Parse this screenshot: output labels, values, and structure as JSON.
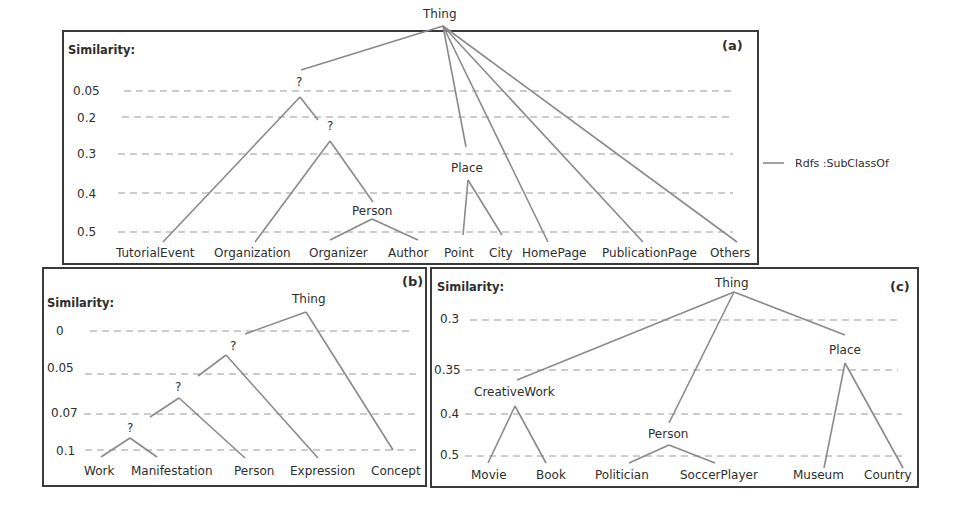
{
  "legend": {
    "line_label": "Rdfs :SubClassOf"
  },
  "colors": {
    "edge": "#8a8a8a",
    "dash": "#9a9a9a",
    "frame": "#3a3a3a",
    "text": "#2e2e2e"
  },
  "panels": [
    {
      "tag": "(a)",
      "axis_title": "Similarity:",
      "levels": [
        "0.05",
        "0.2",
        "0.3",
        "0.4",
        "0.5"
      ],
      "root": "Thing",
      "internal_nodes": [
        "?",
        "?",
        "Person",
        "Place"
      ],
      "leaves": [
        "TutorialEvent",
        "Organization",
        "Organizer",
        "Author",
        "Point",
        "City",
        "HomePage",
        "PublicationPage",
        "Others"
      ]
    },
    {
      "tag": "(b)",
      "axis_title": "Similarity:",
      "levels": [
        "0",
        "0.05",
        "0.07",
        "0.1"
      ],
      "root": "Thing",
      "internal_nodes": [
        "?",
        "?",
        "?"
      ],
      "leaves": [
        "Work",
        "Manifestation",
        "Person",
        "Expression",
        "Concept"
      ]
    },
    {
      "tag": "(c)",
      "axis_title": "Similarity:",
      "levels": [
        "0.3",
        "0.35",
        "0.4",
        "0.5"
      ],
      "root": "Thing",
      "internal_nodes": [
        "CreativeWork",
        "Person",
        "Place"
      ],
      "leaves": [
        "Movie",
        "Book",
        "Politician",
        "SoccerPlayer",
        "Museum",
        "Country"
      ]
    }
  ]
}
